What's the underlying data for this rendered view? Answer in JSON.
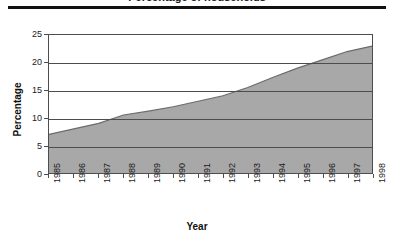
{
  "header": {
    "title_fragment": "Percentage of households",
    "rule_color": "#111111"
  },
  "axis_titles": {
    "x": "Year",
    "y": "Percentage"
  },
  "chart_data": {
    "type": "area",
    "title": "",
    "xlabel": "Year",
    "ylabel": "Percentage",
    "categories": [
      "1985",
      "1986",
      "1987",
      "1988",
      "1989",
      "1990",
      "1991",
      "1992",
      "1993",
      "1994",
      "1995",
      "1996",
      "1997",
      "1998"
    ],
    "x": [
      1985,
      1986,
      1987,
      1988,
      1989,
      1990,
      1991,
      1992,
      1993,
      1994,
      1995,
      1996,
      1997,
      1998
    ],
    "values": [
      7.0,
      8.0,
      9.0,
      10.5,
      11.2,
      12.0,
      13.0,
      14.0,
      15.5,
      17.3,
      19.0,
      20.5,
      22.0,
      23.0
    ],
    "series": [
      {
        "name": "Percentage",
        "values": [
          7.0,
          8.0,
          9.0,
          10.5,
          11.2,
          12.0,
          13.0,
          14.0,
          15.5,
          17.3,
          19.0,
          20.5,
          22.0,
          23.0
        ]
      }
    ],
    "ylim": [
      0,
      25
    ],
    "yticks": [
      0,
      5,
      10,
      15,
      20,
      25
    ],
    "ytick_labels": [
      "0",
      "5",
      "10",
      "15",
      "20",
      "25"
    ],
    "xlim": [
      1985,
      1998
    ],
    "grid": "horizontal",
    "legend": "none",
    "fill_color": "#a8a8a8",
    "line_color": "#6b6b6b",
    "frame_color": "#4d4d4d",
    "xtick_rotation": -90
  }
}
